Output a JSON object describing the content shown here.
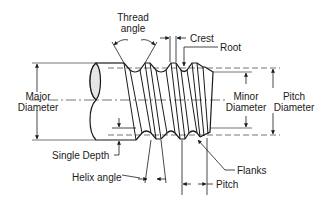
{
  "diagram": {
    "colors": {
      "line": "#1a1a1a",
      "hatch": "#9a9a9a",
      "background": "#ffffff"
    },
    "labels": {
      "thread_angle_line1": "Thread",
      "thread_angle_line2": "angle",
      "crest": "Crest",
      "root": "Root",
      "major_diameter_line1": "Major",
      "major_diameter_line2": "Diameter",
      "minor_diameter_line1": "Minor",
      "minor_diameter_line2": "Diameter",
      "pitch_diameter_line1": "Pitch",
      "pitch_diameter_line2": "Diameter",
      "single_depth": "Single Depth",
      "helix_angle": "Helix angle",
      "flanks": "Flanks",
      "pitch": "Pitch"
    }
  }
}
